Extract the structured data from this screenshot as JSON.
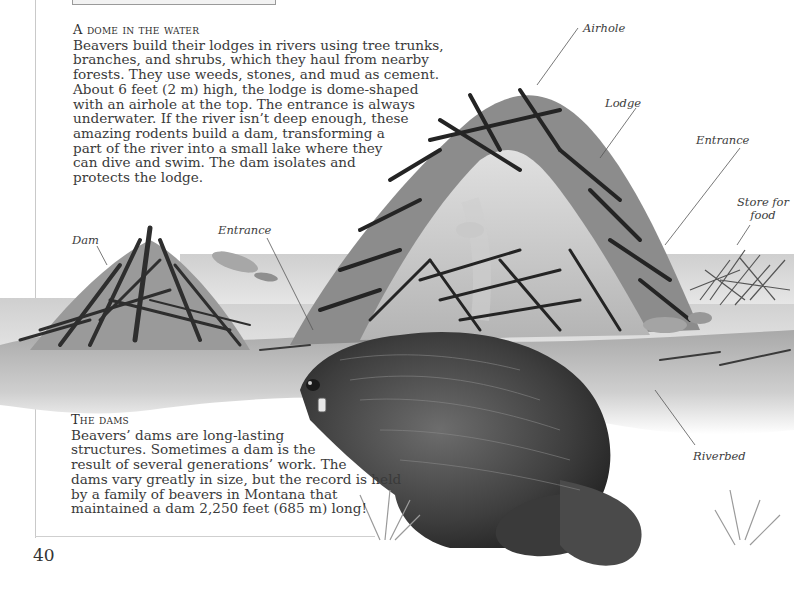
{
  "section_1": {
    "heading": "A dome in the water",
    "lines": [
      "Beavers build their lodges in rivers using tree trunks,",
      "branches, and shrubs, which they haul from nearby",
      "forests. They use weeds, stones, and mud as cement.",
      "About 6 feet (2 m) high, the lodge is dome-shaped",
      "with an airhole at the top. The entrance is always",
      "underwater. If the river isn’t deep enough, these",
      "amazing rodents build a dam, transforming a",
      "part of the river into a small lake where they",
      "can dive and swim. The dam isolates and",
      "protects the lodge."
    ]
  },
  "section_2": {
    "heading": "The dams",
    "lines": [
      "Beavers’ dams are long-lasting",
      "structures. Sometimes a dam is the",
      "result of several generations’ work. The",
      "dams vary greatly in size, but the record is held",
      "by a family of beavers in Montana that",
      "maintained a dam 2,250 feet (685 m) long!"
    ]
  },
  "labels": {
    "airhole": "Airhole",
    "lodge": "Lodge",
    "entrance_right": "Entrance",
    "store_for_food": "Store for food",
    "store_line1": "Store for",
    "store_line2": "food",
    "dam": "Dam",
    "entrance_left": "Entrance",
    "riverbed": "Riverbed"
  },
  "illustration": {
    "subject": "Beaver lodge and dam cross-section with beaver in foreground",
    "colors": {
      "water": "#d9d9d9",
      "mud": "#b8b8b8",
      "sticks": "#2b2b2b",
      "beaver_fur": "#4a4a4a"
    }
  },
  "page_number": "40"
}
